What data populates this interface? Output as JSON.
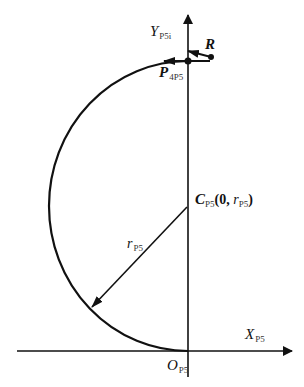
{
  "diagram": {
    "colors": {
      "stroke": "#111111",
      "background": "#ffffff"
    },
    "axes": {
      "x": {
        "label": "X",
        "subscript": "P5"
      },
      "y": {
        "label": "Y",
        "subscript": "P5i"
      }
    },
    "origin": {
      "label": "O",
      "subscript": "P5"
    },
    "center": {
      "label": "C",
      "subscript": "P5",
      "coord_open": "(0, ",
      "coord_var": "r",
      "coord_var_sub": "P5",
      "coord_close": ")"
    },
    "radius": {
      "label": "r",
      "subscript": "P5"
    },
    "point_p": {
      "label": "P",
      "subscript": "4P5"
    },
    "point_r": {
      "label": "R"
    }
  }
}
